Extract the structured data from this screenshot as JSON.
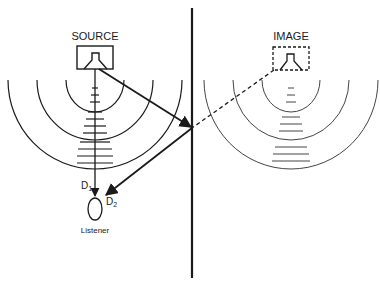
{
  "diagram": {
    "labels": {
      "source": "SOURCE",
      "image": "IMAGE",
      "d1": "D",
      "d1_sub": "1",
      "d2": "D",
      "d2_sub": "2",
      "listener": "Listener"
    },
    "colors": {
      "ink": "#1a1a1a",
      "image_ink": "#444444",
      "background": "#ffffff"
    },
    "elements": [
      "reflecting-wall",
      "source-speaker-box",
      "image-speaker-box-dashed",
      "source-wavefronts",
      "image-wavefronts",
      "direct-path-D1",
      "reflected-path-D2",
      "virtual-path-dashed",
      "listener"
    ]
  }
}
